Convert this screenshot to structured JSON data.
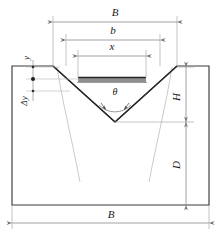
{
  "figure": {
    "type": "engineering-cross-section-diagram",
    "colors": {
      "outline": "#3a3a3a",
      "groove_edge": "#2b2b2b",
      "dimension_line": "#8a8a8a",
      "thin_curve": "#b9b9b9",
      "bar_fill": "#8f8f8f",
      "bar_top_edge": "#262626",
      "background": "#ffffff",
      "text": "#1a1a1a"
    }
  },
  "labels": {
    "top_width": "B",
    "groove_width": "b",
    "layer_width": "x",
    "bottom_width": "B",
    "groove_height": "H",
    "depth_below": "D",
    "angle": "θ",
    "offset_y": "y",
    "offset_delta_y": "Δy"
  },
  "dimensions": {
    "top_B": {
      "label": "B",
      "x1": 53,
      "x2": 177,
      "y": 22
    },
    "top_b": {
      "label": "b",
      "x1": 66,
      "x2": 160,
      "y": 40
    },
    "top_x": {
      "label": "x",
      "x1": 78,
      "x2": 146,
      "y": 56
    },
    "right_H": {
      "label": "H",
      "y1": 67,
      "y2": 122,
      "x": 186
    },
    "right_D": {
      "label": "D",
      "y1": 122,
      "y2": 205,
      "x": 186
    },
    "bottom_B": {
      "label": "B",
      "x1": 12,
      "x2": 209,
      "y": 223
    },
    "left_y": {
      "label": "y",
      "x": 33,
      "y1": 67,
      "y2": 79
    },
    "left_delta_y": {
      "label": "Δy",
      "x": 33,
      "y1": 79,
      "y2": 91
    }
  },
  "geometry": {
    "body": {
      "left": 12,
      "right": 209,
      "top": 66,
      "bottom": 205
    },
    "groove": {
      "top_left_x": 53,
      "top_right_x": 177,
      "apex_x": 115,
      "apex_y": 122,
      "top_y": 66
    },
    "weld_layer": {
      "x1": 78,
      "x2": 146,
      "y_top": 77,
      "y_bottom": 82
    },
    "angle_vertex": {
      "x": 115,
      "y": 122
    }
  }
}
